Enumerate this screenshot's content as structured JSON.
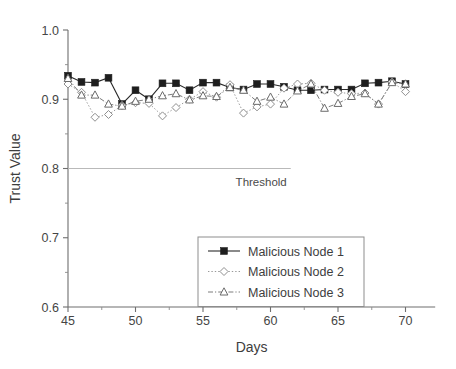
{
  "chart_data": {
    "type": "line",
    "title": "",
    "xlabel": "Days",
    "ylabel": "Trust Value",
    "xlim": [
      45,
      72.2
    ],
    "ylim": [
      0.6,
      1.0
    ],
    "grid": false,
    "legend_position": "lower-center",
    "x_major_ticks": [
      45,
      50,
      55,
      60,
      65,
      70
    ],
    "x_major_tick_labels": [
      "45",
      "50",
      "55",
      "60",
      "65",
      "70"
    ],
    "x_minor_ticks": [
      47.5,
      52.5,
      57.5,
      62.5,
      67.5
    ],
    "y_major_ticks": [
      0.6,
      0.7,
      0.8,
      0.9,
      1.0
    ],
    "y_major_tick_labels": [
      "0.6",
      "0.7",
      "0.8",
      "0.9",
      "1.0"
    ],
    "y_minor_ticks": [
      0.65,
      0.75,
      0.85,
      0.95
    ],
    "x": [
      45,
      46,
      47,
      48,
      49,
      50,
      51,
      52,
      53,
      54,
      55,
      56,
      57,
      58,
      59,
      60,
      61,
      62,
      63,
      64,
      65,
      66,
      67,
      68,
      69,
      70
    ],
    "series": [
      {
        "name": "Malicious Node 1",
        "marker": "filled-square",
        "line_style": "solid",
        "color": "#1e1e1e",
        "values": [
          0.934,
          0.925,
          0.924,
          0.931,
          0.893,
          0.913,
          0.9,
          0.923,
          0.923,
          0.913,
          0.924,
          0.924,
          0.917,
          0.914,
          0.922,
          0.922,
          0.918,
          0.913,
          0.913,
          0.914,
          0.914,
          0.914,
          0.923,
          0.924,
          0.926,
          0.922
        ]
      },
      {
        "name": "Malicious Node 2",
        "marker": "open-diamond",
        "line_style": "dotted",
        "color": "#8f8f8f",
        "values": [
          0.922,
          0.91,
          0.874,
          0.878,
          0.891,
          0.895,
          0.894,
          0.876,
          0.888,
          0.9,
          0.911,
          0.903,
          0.921,
          0.88,
          0.889,
          0.893,
          0.916,
          0.922,
          0.923,
          0.913,
          0.91,
          0.908,
          0.909,
          0.893,
          0.925,
          0.911
        ]
      },
      {
        "name": "Malicious Node 3",
        "marker": "open-triangle",
        "line_style": "dash-dot",
        "color": "#6b6b6b",
        "values": [
          0.93,
          0.906,
          0.906,
          0.893,
          0.89,
          0.897,
          0.9,
          0.905,
          0.908,
          0.899,
          0.905,
          0.904,
          0.917,
          0.913,
          0.897,
          0.903,
          0.893,
          0.912,
          0.922,
          0.887,
          0.894,
          0.904,
          0.908,
          0.893,
          0.924,
          0.922
        ]
      }
    ],
    "annotations": [
      {
        "name": "threshold",
        "label": "Threshold",
        "value": 0.8,
        "x_start": 45,
        "x_end": 61.5
      }
    ]
  }
}
